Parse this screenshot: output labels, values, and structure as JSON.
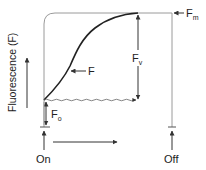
{
  "diagram": {
    "type": "chlorophyll fluorescence induction curve",
    "y_axis_label": "Fluorescence (F)",
    "curve_label": "F",
    "labels": {
      "fm": {
        "main": "F",
        "sub": "m"
      },
      "fv": {
        "main": "F",
        "sub": "v"
      },
      "fo": {
        "main": "F",
        "sub": "o"
      }
    },
    "light_on_label": "On",
    "light_off_label": "Off",
    "colors": {
      "curve": "#222222",
      "frame": "#9a9a9a",
      "arrows": "#333333",
      "text": "#222222"
    }
  }
}
